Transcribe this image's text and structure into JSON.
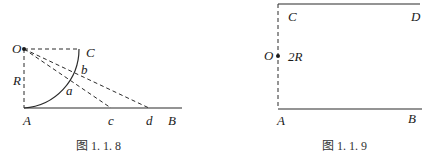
{
  "figures": [
    {
      "id": "fig-1-1-8",
      "caption": "图 1. 1. 8",
      "labels": {
        "O": "O",
        "C": "C",
        "R": "R",
        "b": "b",
        "a": "a",
        "A": "A",
        "c": "c",
        "d": "d",
        "B": "B"
      }
    },
    {
      "id": "fig-1-1-9",
      "caption": "图 1. 1. 9",
      "labels": {
        "C": "C",
        "D": "D",
        "O": "O",
        "twoR": "2R",
        "A": "A",
        "B": "B"
      }
    }
  ],
  "colors": {
    "line": "#2b2b2b",
    "background": "#ffffff"
  }
}
